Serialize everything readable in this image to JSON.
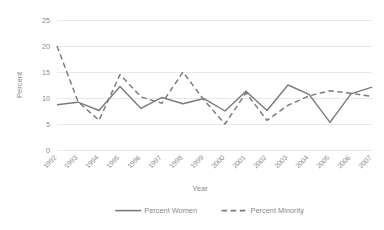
{
  "chart_data": {
    "type": "line",
    "title": "",
    "xlabel": "Year",
    "ylabel": "Percent",
    "categories": [
      "1992",
      "1993",
      "1994",
      "1995",
      "1996",
      "1997",
      "1998",
      "1999",
      "2000",
      "2001",
      "2002",
      "2003",
      "2004",
      "2005",
      "2006",
      "2007"
    ],
    "series": [
      {
        "name": "Percent Women",
        "style": "solid",
        "color": "#7b7b7b",
        "values": [
          8.7,
          9.2,
          7.6,
          12.2,
          8.0,
          10.1,
          8.9,
          9.9,
          7.5,
          11.3,
          7.6,
          12.5,
          10.7,
          5.3,
          10.8,
          12.1
        ]
      },
      {
        "name": "Percent Minority",
        "style": "dashed",
        "color": "#7b7b7b",
        "values": [
          20.0,
          9.3,
          5.7,
          14.5,
          10.2,
          9.0,
          15.0,
          9.6,
          5.0,
          11.0,
          5.7,
          8.6,
          10.4,
          11.4,
          10.9,
          10.3
        ]
      }
    ],
    "ylim": [
      0,
      25
    ],
    "yticks": [
      0,
      5,
      10,
      15,
      20,
      25
    ],
    "ytick_labels": [
      "0",
      "5",
      "10",
      "15",
      "20",
      "25"
    ],
    "grid": true,
    "grid_axis": "y",
    "grid_color": "#e2e2e2",
    "legend_position": "bottom",
    "xtick_rotation": -45
  },
  "legend": {
    "items": [
      {
        "label": "Percent Women",
        "style": "solid"
      },
      {
        "label": "Percent Minority",
        "style": "dashed"
      }
    ]
  },
  "axes": {
    "x_title": "Year",
    "y_title": "Percent"
  }
}
